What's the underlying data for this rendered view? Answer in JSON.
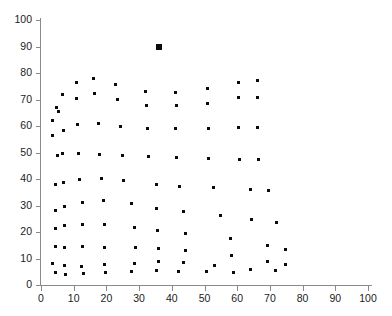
{
  "figure": {
    "background_color": "#ffffff",
    "axis_color": "#8a8a8a",
    "marker_color": "#0b0b0b"
  },
  "chart_data": {
    "type": "scatter",
    "title": "",
    "subtitle": "",
    "xlabel": "",
    "ylabel": "",
    "xlim": [
      0,
      100
    ],
    "ylim": [
      0,
      100
    ],
    "xticks": [
      0,
      10,
      20,
      30,
      40,
      50,
      60,
      70,
      80,
      90,
      100
    ],
    "yticks": [
      0,
      10,
      20,
      30,
      40,
      50,
      60,
      70,
      80,
      90,
      100
    ],
    "xtick_labels": [
      "0",
      "10",
      "20",
      "30",
      "40",
      "50",
      "60",
      "70",
      "80",
      "90",
      "100"
    ],
    "ytick_labels": [
      "0",
      "10",
      "20",
      "30",
      "40",
      "50",
      "60",
      "70",
      "80",
      "90",
      "100"
    ],
    "grid": false,
    "legend": null,
    "legend_position": "none",
    "annotations": [],
    "series": [
      {
        "name": "data",
        "marker": "square",
        "marker_size_px": 3,
        "color": "#0b0b0b",
        "points": [
          [
            3.6,
            62.0
          ],
          [
            3.5,
            56.5
          ],
          [
            4.6,
            67.0
          ],
          [
            5.3,
            65.6
          ],
          [
            4.9,
            49.0
          ],
          [
            4.5,
            38.1
          ],
          [
            4.5,
            28.2
          ],
          [
            4.4,
            21.5
          ],
          [
            4.4,
            14.7
          ],
          [
            3.6,
            8.0
          ],
          [
            4.3,
            4.8
          ],
          [
            6.7,
            71.7
          ],
          [
            6.9,
            58.2
          ],
          [
            6.6,
            49.5
          ],
          [
            7.0,
            38.8
          ],
          [
            7.1,
            29.6
          ],
          [
            7.2,
            22.4
          ],
          [
            7.2,
            14.3
          ],
          [
            7.3,
            7.5
          ],
          [
            7.4,
            4.1
          ],
          [
            10.8,
            76.5
          ],
          [
            10.9,
            70.3
          ],
          [
            11.3,
            60.5
          ],
          [
            11.5,
            49.6
          ],
          [
            11.9,
            39.9
          ],
          [
            12.6,
            31.2
          ],
          [
            12.7,
            22.8
          ],
          [
            12.8,
            14.6
          ],
          [
            12.5,
            7.0
          ],
          [
            12.9,
            4.2
          ],
          [
            16.2,
            77.8
          ],
          [
            16.4,
            72.1
          ],
          [
            17.7,
            61.0
          ],
          [
            17.9,
            49.4
          ],
          [
            18.6,
            40.1
          ],
          [
            19.2,
            31.7
          ],
          [
            19.3,
            22.7
          ],
          [
            19.4,
            14.2
          ],
          [
            19.4,
            7.8
          ],
          [
            19.6,
            4.8
          ],
          [
            22.9,
            75.5
          ],
          [
            23.4,
            69.9
          ],
          [
            24.2,
            60.0
          ],
          [
            24.8,
            49.0
          ],
          [
            25.1,
            39.6
          ],
          [
            27.8,
            30.9
          ],
          [
            28.5,
            21.6
          ],
          [
            28.8,
            14.0
          ],
          [
            28.6,
            8.0
          ],
          [
            27.7,
            5.2
          ],
          [
            32.0,
            73.1
          ],
          [
            32.3,
            67.6
          ],
          [
            32.6,
            59.0
          ],
          [
            32.9,
            48.6
          ],
          [
            35.2,
            37.8
          ],
          [
            35.4,
            28.9
          ],
          [
            35.7,
            20.7
          ],
          [
            35.9,
            13.8
          ],
          [
            35.8,
            8.7
          ],
          [
            35.3,
            5.3
          ],
          [
            41.2,
            72.5
          ],
          [
            41.3,
            67.6
          ],
          [
            41.2,
            59.0
          ],
          [
            41.5,
            48.0
          ],
          [
            42.3,
            37.3
          ],
          [
            43.6,
            27.6
          ],
          [
            44.1,
            19.6
          ],
          [
            44.2,
            13.2
          ],
          [
            43.6,
            8.4
          ],
          [
            42.2,
            5.2
          ],
          [
            50.9,
            74.2
          ],
          [
            51.0,
            68.6
          ],
          [
            51.2,
            59.1
          ],
          [
            51.3,
            47.9
          ],
          [
            52.6,
            36.8
          ],
          [
            55.0,
            26.2
          ],
          [
            57.8,
            17.6
          ],
          [
            58.2,
            11.2
          ],
          [
            53.0,
            7.3
          ],
          [
            50.7,
            5.2
          ],
          [
            60.3,
            76.4
          ],
          [
            60.5,
            70.6
          ],
          [
            60.4,
            59.4
          ],
          [
            60.7,
            47.5
          ],
          [
            64.1,
            36.0
          ],
          [
            64.5,
            24.6
          ],
          [
            69.2,
            15.0
          ],
          [
            69.4,
            8.9
          ],
          [
            64.1,
            6.0
          ],
          [
            58.8,
            4.8
          ],
          [
            66.3,
            77.3
          ],
          [
            66.3,
            70.8
          ],
          [
            66.3,
            59.5
          ],
          [
            66.4,
            47.2
          ],
          [
            69.6,
            35.7
          ],
          [
            71.9,
            23.4
          ],
          [
            74.9,
            13.4
          ],
          [
            74.9,
            7.7
          ],
          [
            71.7,
            5.6
          ]
        ]
      },
      {
        "name": "highlighted-outlier",
        "marker": "square",
        "marker_size_px": 6,
        "color": "#0b0b0b",
        "points": [
          [
            36.1,
            89.8
          ]
        ]
      }
    ]
  }
}
